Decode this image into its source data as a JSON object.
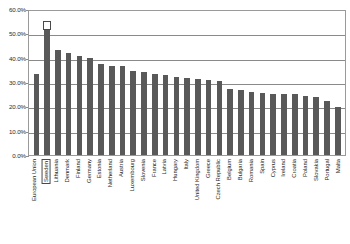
{
  "chart_data": {
    "type": "bar",
    "title": "",
    "subtitle": "",
    "xlabel": "",
    "ylabel": "",
    "ylim": [
      0,
      60
    ],
    "y_tick_step": 10,
    "y_tick_labels": [
      "0.0%",
      "10.0%",
      "20.0%",
      "30.0%",
      "40.0%",
      "50.0%",
      "60.0%"
    ],
    "y_tick_values": [
      0,
      10,
      20,
      30,
      40,
      50,
      60
    ],
    "grid": true,
    "grid_axis": "y",
    "legend": false,
    "legend_position": "none",
    "value_unit": "%",
    "bar_color": "#595959",
    "plot_border_color": "#9a9a9a",
    "gridline_color": "#8a8a8a",
    "highlight_color": "#4a4a4a",
    "highlighted_category": "Sweden",
    "categories": [
      "European Union",
      "Sweden",
      "Lithuania",
      "Denmark",
      "Finland",
      "Germany",
      "Estonia",
      "Netherland",
      "Austria",
      "Luxembourg",
      "Slovenia",
      "France",
      "Latvia",
      "Hungary",
      "Italy",
      "United Kingdom",
      "Greece",
      "Czech Republic",
      "Belgium",
      "Bulgaria",
      "Romania",
      "Spain",
      "Cyprus",
      "Ireland",
      "Croatia",
      "Poland",
      "Slovakia",
      "Portugal",
      "Malta"
    ],
    "values": [
      33.8,
      52.5,
      43.6,
      42.4,
      41.2,
      40.5,
      37.9,
      36.9,
      37.0,
      35.2,
      34.6,
      33.9,
      33.5,
      32.4,
      32.2,
      31.7,
      31.2,
      30.7,
      27.3,
      27.0,
      26.3,
      25.8,
      25.6,
      25.5,
      25.4,
      24.7,
      24.0,
      22.4,
      19.8
    ]
  }
}
